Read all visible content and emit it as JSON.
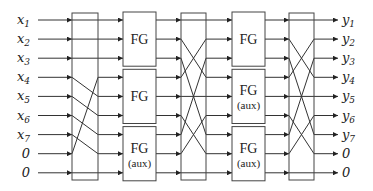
{
  "diagram": {
    "inputs": [
      {
        "base": "x",
        "sub": "1"
      },
      {
        "base": "x",
        "sub": "2"
      },
      {
        "base": "x",
        "sub": "3"
      },
      {
        "base": "x",
        "sub": "4"
      },
      {
        "base": "x",
        "sub": "5"
      },
      {
        "base": "x",
        "sub": "6"
      },
      {
        "base": "x",
        "sub": "7"
      },
      {
        "base": "0",
        "sub": ""
      },
      {
        "base": "0",
        "sub": ""
      }
    ],
    "outputs": [
      {
        "base": "y",
        "sub": "1"
      },
      {
        "base": "y",
        "sub": "2"
      },
      {
        "base": "y",
        "sub": "3"
      },
      {
        "base": "y",
        "sub": "4"
      },
      {
        "base": "y",
        "sub": "5"
      },
      {
        "base": "y",
        "sub": "6"
      },
      {
        "base": "y",
        "sub": "7"
      },
      {
        "base": "0",
        "sub": ""
      },
      {
        "base": "0",
        "sub": ""
      }
    ],
    "stage1_blocks": [
      {
        "label": "FG",
        "note": ""
      },
      {
        "label": "FG",
        "note": ""
      },
      {
        "label": "FG",
        "note": "(aux)"
      }
    ],
    "stage2_blocks": [
      {
        "label": "FG",
        "note": ""
      },
      {
        "label": "FG",
        "note": "(aux)"
      },
      {
        "label": "FG",
        "note": "(aux)"
      }
    ],
    "permutations": [
      {
        "name": "perm-1",
        "map": [
          1,
          2,
          3,
          8,
          4,
          5,
          6,
          7,
          9
        ]
      },
      {
        "name": "perm-2",
        "map": [
          1,
          4,
          7,
          2,
          5,
          8,
          3,
          6,
          9
        ]
      },
      {
        "name": "perm-3",
        "map": [
          1,
          4,
          7,
          2,
          5,
          8,
          3,
          6,
          9
        ]
      }
    ]
  }
}
